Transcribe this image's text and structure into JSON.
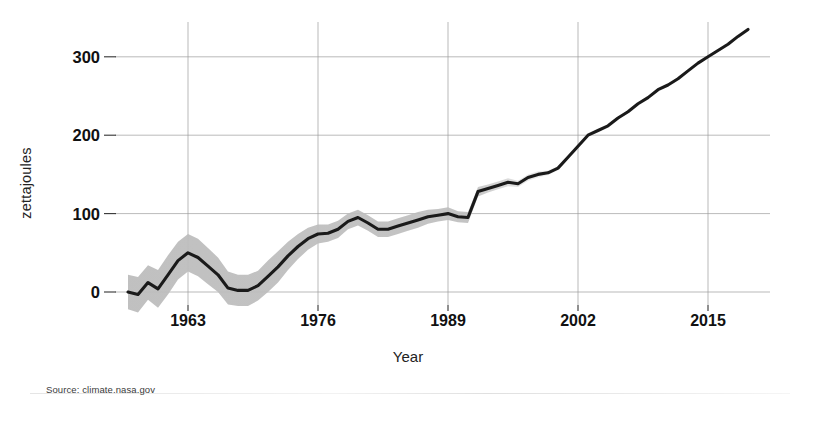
{
  "source_note": "Source: climate.nasa.gov",
  "chart_data": {
    "type": "line",
    "title": "",
    "xlabel": "Year",
    "ylabel": "zettajoules",
    "xlim": [
      1957,
      1019
    ],
    "x_range": [
      1957,
      2019
    ],
    "ylim": [
      -30,
      345
    ],
    "grid": true,
    "legend": null,
    "xticks": [
      1963,
      1976,
      1989,
      2002,
      2015
    ],
    "xtick_labels": [
      "1963",
      "1976",
      "1989",
      "2002",
      "2015"
    ],
    "yticks": [
      0,
      100,
      200,
      300
    ],
    "ytick_labels": [
      "0",
      "100",
      "200",
      "300"
    ],
    "series": [
      {
        "name": "Ocean heat content (0-700m)",
        "color": "#1a1a1a",
        "band_color": "#b9b9b9",
        "x": [
          1957,
          1958,
          1959,
          1960,
          1961,
          1962,
          1963,
          1964,
          1965,
          1966,
          1967,
          1968,
          1969,
          1970,
          1971,
          1972,
          1973,
          1974,
          1975,
          1976,
          1977,
          1978,
          1979,
          1980,
          1981,
          1982,
          1983,
          1984,
          1985,
          1986,
          1987,
          1988,
          1989,
          1990,
          1991,
          1992,
          1993,
          1994,
          1995,
          1996,
          1997,
          1998,
          1999,
          2000,
          2001,
          2002,
          2003,
          2004,
          2005,
          2006,
          2007,
          2008,
          2009,
          2010,
          2011,
          2012,
          2013,
          2014,
          2015,
          2016,
          2017,
          2018,
          2019
        ],
        "values": [
          0,
          -3,
          12,
          4,
          22,
          40,
          50,
          44,
          33,
          22,
          5,
          2,
          2,
          8,
          20,
          32,
          46,
          58,
          68,
          74,
          75,
          80,
          90,
          95,
          88,
          80,
          80,
          84,
          88,
          92,
          96,
          98,
          100,
          96,
          95,
          128,
          132,
          136,
          140,
          138,
          146,
          150,
          152,
          158,
          172,
          186,
          200,
          206,
          212,
          222,
          230,
          240,
          248,
          258,
          264,
          272,
          282,
          292,
          300,
          308,
          316,
          326,
          335
        ],
        "band_lower": [
          -22,
          -26,
          -10,
          -20,
          -3,
          16,
          26,
          20,
          10,
          0,
          -16,
          -18,
          -18,
          -11,
          0,
          12,
          28,
          42,
          54,
          62,
          64,
          69,
          80,
          85,
          78,
          70,
          70,
          74,
          78,
          82,
          87,
          90,
          92,
          89,
          88,
          122,
          127,
          131,
          135,
          134,
          142,
          146,
          149,
          155,
          169,
          183,
          197,
          204,
          210,
          220,
          228,
          238,
          246,
          256,
          262,
          270,
          280,
          290,
          298,
          306,
          314,
          324,
          333
        ],
        "band_upper": [
          22,
          19,
          34,
          28,
          47,
          64,
          74,
          68,
          56,
          44,
          26,
          22,
          22,
          27,
          40,
          52,
          64,
          74,
          82,
          86,
          86,
          91,
          100,
          105,
          98,
          90,
          90,
          94,
          98,
          102,
          105,
          106,
          108,
          103,
          102,
          134,
          137,
          141,
          145,
          142,
          150,
          154,
          155,
          161,
          175,
          189,
          203,
          208,
          214,
          224,
          232,
          242,
          250,
          260,
          266,
          274,
          284,
          294,
          302,
          310,
          318,
          328,
          337
        ]
      }
    ]
  }
}
